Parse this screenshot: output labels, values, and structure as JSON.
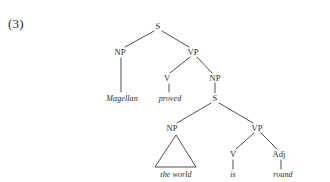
{
  "figure": {
    "example_number": "(3)",
    "type": "syntax-tree",
    "sentence": "Magellan proved the world is round",
    "line_color": "#3a3a3a",
    "text_color": "#2b2b2b",
    "background_color": "#ffffff"
  },
  "nodes": [
    {
      "id": "S1",
      "label": "S",
      "x": 158,
      "y": 26,
      "kind": "category"
    },
    {
      "id": "NP1",
      "label": "NP",
      "x": 120,
      "y": 52,
      "kind": "category"
    },
    {
      "id": "VP1",
      "label": "VP",
      "x": 193,
      "y": 52,
      "kind": "category"
    },
    {
      "id": "V1",
      "label": "V",
      "x": 167,
      "y": 78,
      "kind": "category"
    },
    {
      "id": "NP2",
      "label": "NP",
      "x": 215,
      "y": 78,
      "kind": "category"
    },
    {
      "id": "S2",
      "label": "S",
      "x": 215,
      "y": 98,
      "kind": "category"
    },
    {
      "id": "NP3",
      "label": "NP",
      "x": 172,
      "y": 128,
      "kind": "category"
    },
    {
      "id": "VP2",
      "label": "VP",
      "x": 257,
      "y": 128,
      "kind": "category"
    },
    {
      "id": "V2",
      "label": "V",
      "x": 233,
      "y": 154,
      "kind": "category"
    },
    {
      "id": "Adj1",
      "label": "Adj",
      "x": 279,
      "y": 154,
      "kind": "category"
    }
  ],
  "leaves": [
    {
      "id": "L1",
      "label": "Magellan",
      "x": 122,
      "y": 98,
      "parent": "NP1"
    },
    {
      "id": "L2",
      "label": "proved",
      "x": 170,
      "y": 98,
      "parent": "V1"
    },
    {
      "id": "L3",
      "label": "the world",
      "x": 176,
      "y": 174,
      "parent": "NP3"
    },
    {
      "id": "L4",
      "label": "is",
      "x": 233,
      "y": 174,
      "parent": "V2"
    },
    {
      "id": "L5",
      "label": "round",
      "x": 283,
      "y": 174,
      "parent": "Adj1"
    }
  ],
  "branches": [
    {
      "from": "S1",
      "to": "NP1",
      "x1": 154,
      "y1": 31,
      "x2": 125,
      "y2": 47
    },
    {
      "from": "S1",
      "to": "VP1",
      "x1": 162,
      "y1": 31,
      "x2": 189,
      "y2": 47
    },
    {
      "from": "VP1",
      "to": "V1",
      "x1": 190,
      "y1": 57,
      "x2": 170,
      "y2": 73
    },
    {
      "from": "VP1",
      "to": "NP2",
      "x1": 197,
      "y1": 57,
      "x2": 212,
      "y2": 73
    },
    {
      "from": "NP2",
      "to": "S2",
      "x1": 215,
      "y1": 83,
      "x2": 215,
      "y2": 93
    },
    {
      "from": "S2",
      "to": "NP3",
      "x1": 211,
      "y1": 103,
      "x2": 177,
      "y2": 123
    },
    {
      "from": "S2",
      "to": "VP2",
      "x1": 219,
      "y1": 103,
      "x2": 253,
      "y2": 123
    },
    {
      "from": "VP2",
      "to": "V2",
      "x1": 254,
      "y1": 133,
      "x2": 236,
      "y2": 149
    },
    {
      "from": "VP2",
      "to": "Adj1",
      "x1": 261,
      "y1": 133,
      "x2": 277,
      "y2": 149
    },
    {
      "from": "NP1",
      "to": "L1",
      "x1": 121,
      "y1": 58,
      "x2": 121,
      "y2": 92
    },
    {
      "from": "V1",
      "to": "L2",
      "x1": 169,
      "y1": 84,
      "x2": 169,
      "y2": 92
    },
    {
      "from": "V2",
      "to": "L4",
      "x1": 233,
      "y1": 160,
      "x2": 233,
      "y2": 169
    },
    {
      "from": "Adj1",
      "to": "L5",
      "x1": 281,
      "y1": 160,
      "x2": 281,
      "y2": 169
    }
  ],
  "triangle": {
    "parent": "NP3",
    "covers": "the world",
    "apex_x": 176,
    "apex_y": 135,
    "left_x": 155,
    "left_y": 167,
    "right_x": 196,
    "right_y": 167
  }
}
